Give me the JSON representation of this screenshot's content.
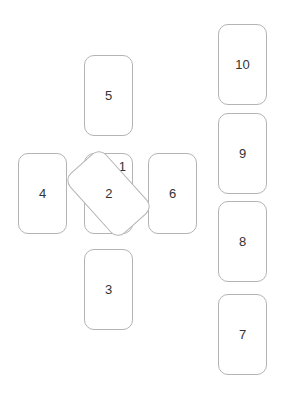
{
  "layout": {
    "title": "",
    "description": "Celtic Cross tarot spread: cross of six positions plus staff column of four"
  },
  "cards": [
    {
      "position": 1,
      "label": "1",
      "x": 84,
      "y": 153,
      "rotated": false,
      "behind": true
    },
    {
      "position": 2,
      "label": "2",
      "x": 84,
      "y": 153,
      "rotated": true,
      "behind": false
    },
    {
      "position": 3,
      "label": "3",
      "x": 84,
      "y": 249,
      "rotated": false,
      "behind": false
    },
    {
      "position": 4,
      "label": "4",
      "x": 18,
      "y": 153,
      "rotated": false,
      "behind": false
    },
    {
      "position": 5,
      "label": "5",
      "x": 84,
      "y": 55,
      "rotated": false,
      "behind": false
    },
    {
      "position": 6,
      "label": "6",
      "x": 148,
      "y": 153,
      "rotated": false,
      "behind": false
    },
    {
      "position": 7,
      "label": "7",
      "x": 218,
      "y": 294,
      "rotated": false,
      "behind": false
    },
    {
      "position": 8,
      "label": "8",
      "x": 218,
      "y": 201,
      "rotated": false,
      "behind": false
    },
    {
      "position": 9,
      "label": "9",
      "x": 218,
      "y": 113,
      "rotated": false,
      "behind": false
    },
    {
      "position": 10,
      "label": "10",
      "x": 218,
      "y": 24,
      "rotated": false,
      "behind": false
    }
  ],
  "colors": {
    "border": "#b4b4b4",
    "text": "#333333",
    "background": "#ffffff"
  }
}
